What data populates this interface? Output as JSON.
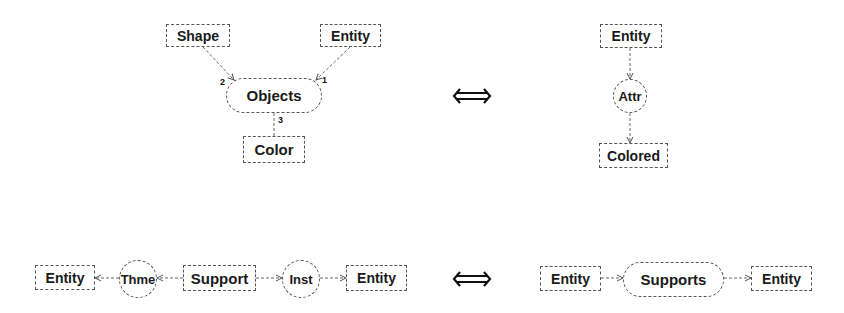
{
  "diagrams": [
    {
      "id": "top-left",
      "description": "N-ary relation Objects with three arguments",
      "nodes": {
        "shape": {
          "label": "Shape",
          "kind": "concept"
        },
        "entity": {
          "label": "Entity",
          "kind": "concept"
        },
        "objects": {
          "label": "Objects",
          "kind": "relation"
        },
        "color": {
          "label": "Color",
          "kind": "concept"
        }
      },
      "edge_labels": {
        "shape_to_objects": "2",
        "entity_to_objects": "1",
        "objects_to_color": "3"
      }
    },
    {
      "id": "top-right",
      "description": "Entity -> Attr -> Colored",
      "nodes": {
        "entity": {
          "label": "Entity",
          "kind": "concept"
        },
        "attr": {
          "label": "Attr",
          "kind": "relation"
        },
        "colored": {
          "label": "Colored",
          "kind": "concept"
        }
      }
    },
    {
      "id": "bottom-left",
      "description": "Entity <- Thme <- Support -> Inst -> Entity",
      "nodes": {
        "entity_left": {
          "label": "Entity",
          "kind": "concept"
        },
        "thme": {
          "label": "Thme",
          "kind": "relation"
        },
        "support": {
          "label": "Support",
          "kind": "concept"
        },
        "inst": {
          "label": "Inst",
          "kind": "relation"
        },
        "entity_right": {
          "label": "Entity",
          "kind": "concept"
        }
      }
    },
    {
      "id": "bottom-right",
      "description": "Entity -> Supports -> Entity",
      "nodes": {
        "entity_left": {
          "label": "Entity",
          "kind": "concept"
        },
        "supports": {
          "label": "Supports",
          "kind": "relation"
        },
        "entity_right": {
          "label": "Entity",
          "kind": "concept"
        }
      }
    }
  ],
  "equivalences": [
    {
      "symbol": "⇔",
      "icon": "double-arrow-icon",
      "between": [
        "top-left",
        "top-right"
      ]
    },
    {
      "symbol": "⇔",
      "icon": "double-arrow-icon",
      "between": [
        "bottom-left",
        "bottom-right"
      ]
    }
  ],
  "colors": {
    "stroke": "#555555",
    "text": "#1a1a1a",
    "background": "#ffffff"
  }
}
